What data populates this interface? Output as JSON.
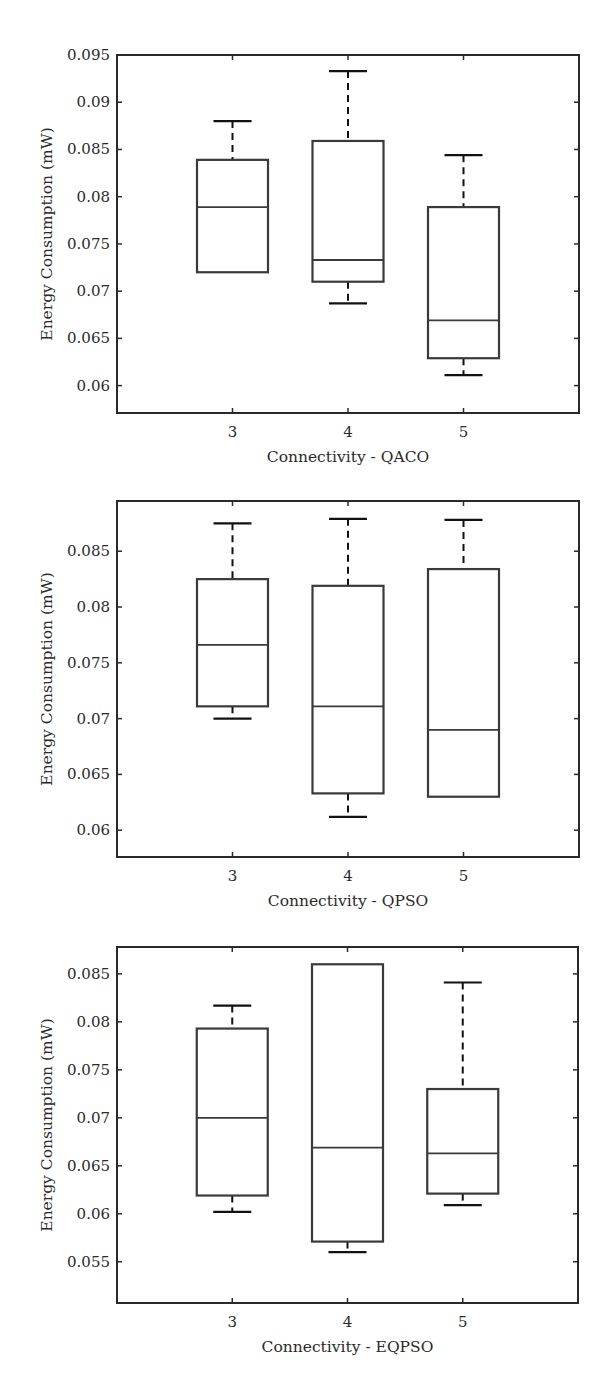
{
  "figure": {
    "background": "#ffffff",
    "line_color": "#3a3a3a",
    "axis_color": "#2a2a2a"
  },
  "chart_data": [
    {
      "type": "box",
      "title": "",
      "xlabel": "Connectivity - QACO",
      "ylabel": "Energy Consumption (mW)",
      "categories": [
        "3",
        "4",
        "5"
      ],
      "ylim": [
        0.0571,
        0.095
      ],
      "yticks": [
        0.06,
        0.065,
        0.07,
        0.075,
        0.08,
        0.085,
        0.09,
        0.095
      ],
      "ytick_labels": [
        "0.06",
        "0.065",
        "0.07",
        "0.075",
        "0.08",
        "0.085",
        "0.09",
        "0.095"
      ],
      "grid": false,
      "boxes": [
        {
          "category": "3",
          "whisker_high": 0.088,
          "q3": 0.0839,
          "median": 0.0789,
          "q1": 0.072,
          "whisker_low": 0.072
        },
        {
          "category": "4",
          "whisker_high": 0.0933,
          "q3": 0.0859,
          "median": 0.0733,
          "q1": 0.071,
          "whisker_low": 0.0687
        },
        {
          "category": "5",
          "whisker_high": 0.0844,
          "q3": 0.0789,
          "median": 0.0669,
          "q1": 0.0629,
          "whisker_low": 0.0611
        }
      ],
      "frame": {
        "left": 117,
        "right": 579,
        "top": 55,
        "bottom": 413
      }
    },
    {
      "type": "box",
      "title": "",
      "xlabel": "Connectivity - QPSO",
      "ylabel": "Energy Consumption (mW)",
      "categories": [
        "3",
        "4",
        "5"
      ],
      "ylim": [
        0.0576,
        0.0895
      ],
      "yticks": [
        0.06,
        0.065,
        0.07,
        0.075,
        0.08,
        0.085
      ],
      "ytick_labels": [
        "0.06",
        "0.065",
        "0.07",
        "0.075",
        "0.08",
        "0.085"
      ],
      "grid": false,
      "boxes": [
        {
          "category": "3",
          "whisker_high": 0.0875,
          "q3": 0.0825,
          "median": 0.0766,
          "q1": 0.0711,
          "whisker_low": 0.07
        },
        {
          "category": "4",
          "whisker_high": 0.0879,
          "q3": 0.0819,
          "median": 0.0711,
          "q1": 0.0633,
          "whisker_low": 0.0612
        },
        {
          "category": "5",
          "whisker_high": 0.0878,
          "q3": 0.0834,
          "median": 0.069,
          "q1": 0.063,
          "whisker_low": 0.063
        }
      ],
      "frame": {
        "left": 117,
        "right": 579,
        "top": 501,
        "bottom": 857
      }
    },
    {
      "type": "box",
      "title": "",
      "xlabel": "Connectivity - EQPSO",
      "ylabel": "Energy Consumption (mW)",
      "categories": [
        "3",
        "4",
        "5"
      ],
      "ylim": [
        0.0507,
        0.0878
      ],
      "yticks": [
        0.055,
        0.06,
        0.065,
        0.07,
        0.075,
        0.08,
        0.085
      ],
      "ytick_labels": [
        "0.055",
        "0.06",
        "0.065",
        "0.07",
        "0.075",
        "0.08",
        "0.085"
      ],
      "grid": false,
      "boxes": [
        {
          "category": "3",
          "whisker_high": 0.0817,
          "q3": 0.0793,
          "median": 0.07,
          "q1": 0.0619,
          "whisker_low": 0.0602
        },
        {
          "category": "4",
          "whisker_high": 0.086,
          "q3": 0.086,
          "median": 0.0669,
          "q1": 0.0571,
          "whisker_low": 0.056
        },
        {
          "category": "5",
          "whisker_high": 0.0841,
          "q3": 0.073,
          "median": 0.0663,
          "q1": 0.0621,
          "whisker_low": 0.0609
        }
      ],
      "frame": {
        "left": 117,
        "right": 578,
        "top": 947,
        "bottom": 1303
      }
    }
  ]
}
